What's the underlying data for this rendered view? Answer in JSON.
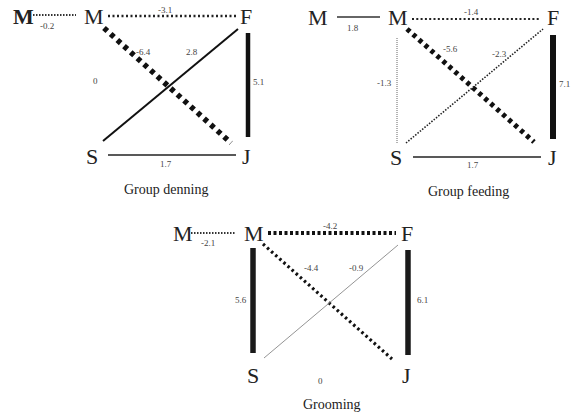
{
  "panels": [
    {
      "title": "Group denning",
      "nodes": {
        "m_outer": "M",
        "m": "M",
        "f": "F",
        "s": "S",
        "j": "J"
      },
      "edges": {
        "m_outer_m": "-0.2",
        "m_f": "-3.1",
        "m_j": "-6.4",
        "s_f": "2.8",
        "m_s": "0",
        "f_j": "5.1",
        "s_j": "1.7"
      }
    },
    {
      "title": "Group feeding",
      "nodes": {
        "m_outer": "M",
        "m": "M",
        "f": "F",
        "s": "S",
        "j": "J"
      },
      "edges": {
        "m_outer_m": "1.8",
        "m_f": "-1.4",
        "m_j": "-5.6",
        "s_f": "-2.3",
        "m_s": "-1.3",
        "f_j": "7.1",
        "s_j": "1.7"
      }
    },
    {
      "title": "Grooming",
      "nodes": {
        "m_outer": "M",
        "m": "M",
        "f": "F",
        "s": "S",
        "j": "J"
      },
      "edges": {
        "m_outer_m": "-2.1",
        "m_f": "-4.2",
        "m_j": "-4.4",
        "s_f": "-0.9",
        "m_s": "5.6",
        "f_j": "6.1",
        "s_j": "0"
      }
    }
  ],
  "legend_semantics": {
    "solid": "positive association (thickness ~ magnitude)",
    "dotted": "negative association (dot size ~ magnitude)"
  }
}
